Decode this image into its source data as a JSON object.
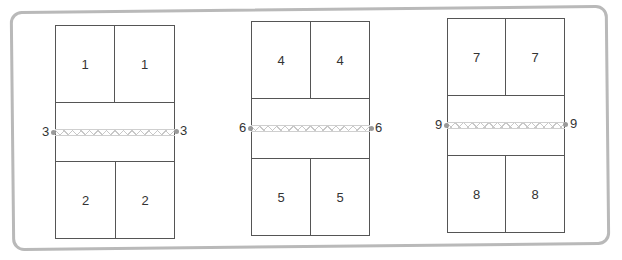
{
  "diagram": {
    "colors": {
      "frame": "#b9b9b9",
      "court_lines": "#555555",
      "net": "#c8c8c8",
      "text": "#333333"
    },
    "courts": [
      {
        "name": "court-1",
        "top_left_label": "1",
        "top_right_label": "1",
        "bottom_left_label": "2",
        "bottom_right_label": "2",
        "net_left_label": "3",
        "net_right_label": "3"
      },
      {
        "name": "court-2",
        "top_left_label": "4",
        "top_right_label": "4",
        "bottom_left_label": "5",
        "bottom_right_label": "5",
        "net_left_label": "6",
        "net_right_label": "6"
      },
      {
        "name": "court-3",
        "top_left_label": "7",
        "top_right_label": "7",
        "bottom_left_label": "8",
        "bottom_right_label": "8",
        "net_left_label": "9",
        "net_right_label": "9"
      }
    ]
  }
}
